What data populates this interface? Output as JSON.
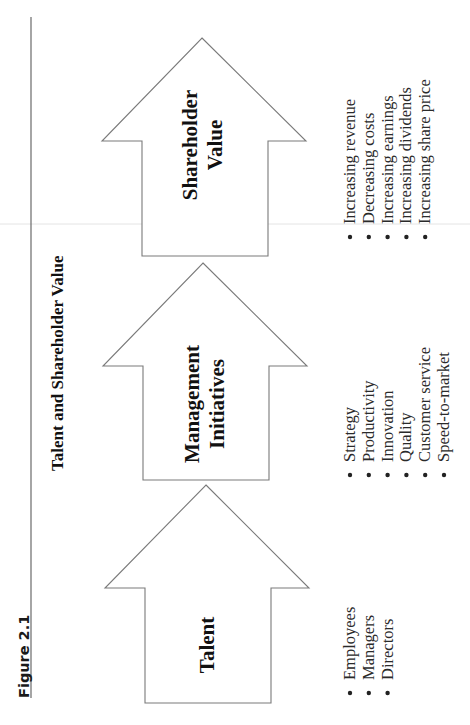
{
  "figure": {
    "label": "Figure 2.1",
    "title": "Talent and Shareholder Value",
    "orientation": "rotated -90deg (landscape figure on portrait page)"
  },
  "arrows": [
    {
      "label_lines": [
        "Talent"
      ],
      "bullets": [
        "Employees",
        "Managers",
        "Directors"
      ]
    },
    {
      "label_lines": [
        "Management",
        "Initiatives"
      ],
      "bullets": [
        "Strategy",
        "Productivity",
        "Innovation",
        "Quality",
        "Customer service",
        "Speed-to-market"
      ]
    },
    {
      "label_lines": [
        "Shareholder",
        "Value"
      ],
      "bullets": [
        "Increasing revenue",
        "Decreasing costs",
        "Increasing earnings",
        "Increasing dividends",
        "Increasing share price"
      ]
    }
  ],
  "colors": {
    "outline": "#7a7a7a",
    "text": "#111111",
    "background": "#ffffff"
  }
}
